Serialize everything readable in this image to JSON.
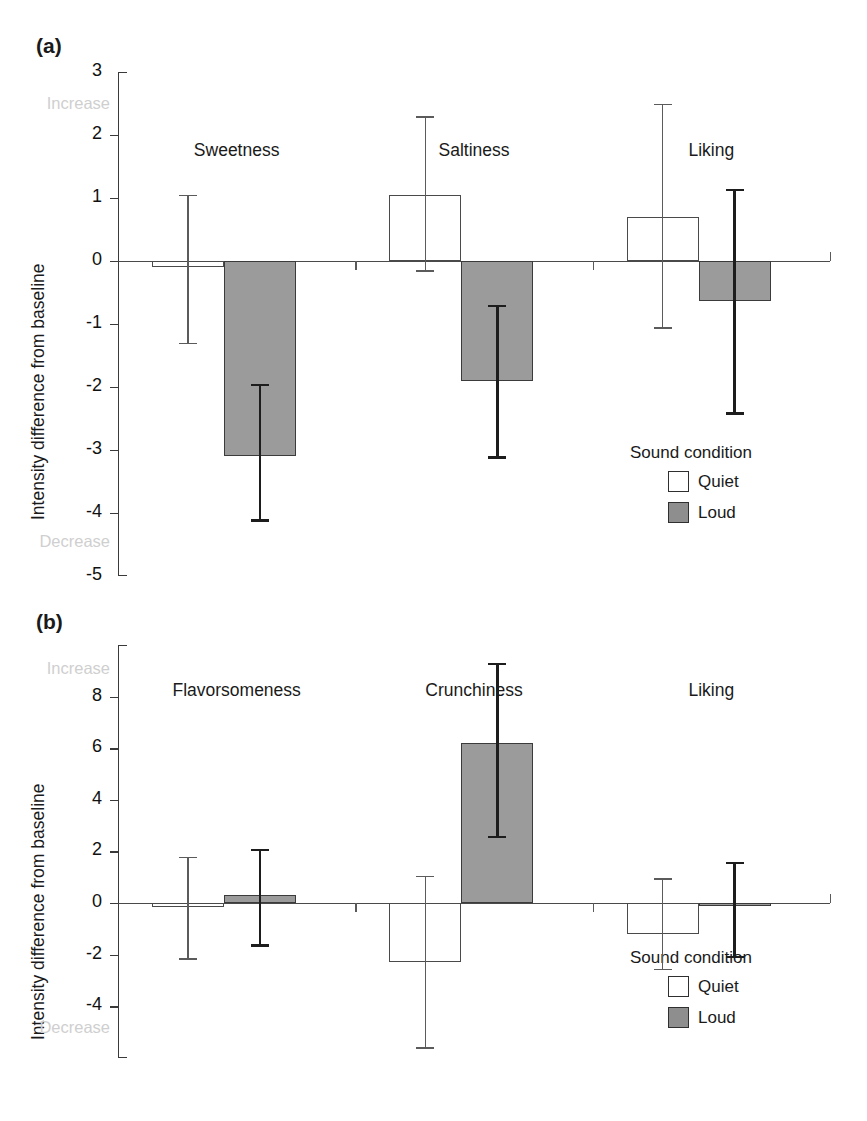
{
  "figure": {
    "panels": [
      {
        "letter": "(a)"
      },
      {
        "letter": "(b)"
      }
    ],
    "legend": {
      "title": "Sound condition",
      "entries": [
        {
          "label": "Quiet",
          "color": "#ffffff"
        },
        {
          "label": "Loud",
          "color": "#8e8e8e"
        }
      ]
    },
    "axis": {
      "ylabel": "Intensity difference from baseline",
      "top_end_label": "Increase",
      "bottom_end_label": "Decrease"
    }
  },
  "chart_data": [
    {
      "type": "bar",
      "panel": "(a)",
      "title": "",
      "xlabel": "",
      "ylabel": "Intensity difference from baseline",
      "ylim": [
        -5,
        3
      ],
      "yticks": [
        3,
        2,
        1,
        0,
        -1,
        -2,
        -3,
        -4,
        -5
      ],
      "ytick_labels": [
        "3",
        "2",
        "1",
        "0",
        "-1",
        "-2",
        "-3",
        "-4",
        "-5"
      ],
      "axis_end_labels": {
        "top": "Increase",
        "bottom": "Decrease"
      },
      "grid": false,
      "legend_position": "bottom-right",
      "categories": [
        "Sweetness",
        "Saltiness",
        "Liking"
      ],
      "series": [
        {
          "name": "Quiet",
          "color": "#ffffff",
          "values": [
            -0.1,
            1.05,
            0.7
          ],
          "err_upper": [
            1.05,
            2.3,
            2.5
          ],
          "err_lower": [
            -1.3,
            -0.15,
            -1.05
          ]
        },
        {
          "name": "Loud",
          "color": "#9b9b9b",
          "values": [
            -3.1,
            -1.9,
            -0.63
          ],
          "err_upper": [
            -1.95,
            -0.7,
            1.15
          ],
          "err_lower": [
            -4.1,
            -3.1,
            -2.4
          ]
        }
      ]
    },
    {
      "type": "bar",
      "panel": "(b)",
      "title": "",
      "xlabel": "",
      "ylabel": "Intensity difference from baseline",
      "ylim": [
        -6,
        10
      ],
      "yticks": [
        10,
        8,
        6,
        4,
        2,
        0,
        -2,
        -4,
        -6
      ],
      "ytick_labels": [
        "",
        "8",
        "6",
        "4",
        "2",
        "0",
        "-2",
        "-4",
        ""
      ],
      "axis_end_labels": {
        "top": "Increase",
        "bottom": "Decrease"
      },
      "grid": false,
      "legend_position": "bottom-right",
      "categories": [
        "Flavorsomeness",
        "Crunchiness",
        "Liking"
      ],
      "series": [
        {
          "name": "Quiet",
          "color": "#ffffff",
          "values": [
            -0.15,
            -2.3,
            -1.2
          ],
          "err_upper": [
            1.8,
            1.05,
            0.95
          ],
          "err_lower": [
            -2.15,
            -5.6,
            -2.55
          ]
        },
        {
          "name": "Loud",
          "color": "#9b9b9b",
          "values": [
            0.3,
            6.2,
            -0.1
          ],
          "err_upper": [
            2.1,
            9.3,
            1.6
          ],
          "err_lower": [
            -1.6,
            2.6,
            -2.05
          ]
        }
      ]
    }
  ]
}
